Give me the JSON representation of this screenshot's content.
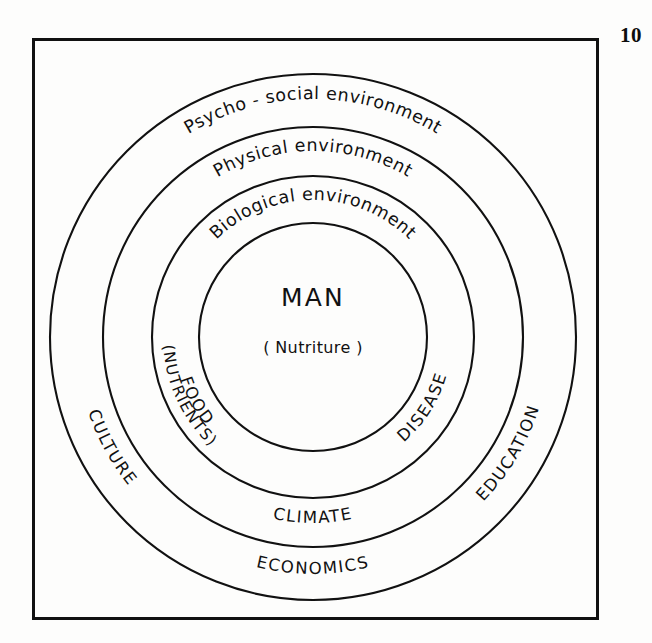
{
  "page": {
    "page_number": "10",
    "background_color": "#fdfdfc",
    "ink_color": "#111111"
  },
  "diagram": {
    "type": "concentric-rings",
    "title_center": "MAN",
    "subtitle_center": "( Nutriture )",
    "center_x": 313,
    "center_y": 337,
    "rings": [
      {
        "id": "psycho-social",
        "label": "Psycho - social   environment",
        "radius": 263,
        "order": 4,
        "outer_labels": [
          "CULTURE",
          "ECONOMICS",
          "EDUCATION"
        ]
      },
      {
        "id": "physical",
        "label": "Physical   environment",
        "radius": 210,
        "order": 3,
        "outer_labels": [
          "CLIMATE"
        ]
      },
      {
        "id": "biological",
        "label": "Biological   environment",
        "radius": 161,
        "order": 2,
        "outer_labels": [
          "FOOD",
          "(NUTRIENTS)",
          "DISEASE"
        ]
      },
      {
        "id": "man-core",
        "label": "MAN",
        "radius": 114,
        "order": 1,
        "outer_labels": []
      }
    ],
    "labels": {
      "psycho_social_environment": "Psycho - social   environment",
      "physical_environment": "Physical   environment",
      "biological_environment": "Biological   environment",
      "man": "MAN",
      "nutriture": "( Nutriture )",
      "food": "FOOD",
      "nutrients": "(NUTRIENTS)",
      "disease": "DISEASE",
      "climate": "CLIMATE",
      "culture": "CULTURE",
      "economics": "ECONOMICS",
      "education": "EDUCATION"
    }
  }
}
